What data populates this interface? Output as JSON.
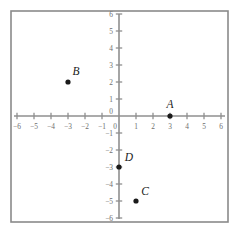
{
  "chart_data": {
    "type": "scatter",
    "title": "",
    "xlabel": "",
    "ylabel": "",
    "xlim": [
      -6.6,
      6.6
    ],
    "ylim": [
      -6.6,
      6.6
    ],
    "grid": false,
    "legend": null,
    "x_ticks": [
      -6,
      -5,
      -4,
      -3,
      -2,
      -1,
      0,
      1,
      2,
      3,
      4,
      5,
      6
    ],
    "y_ticks": [
      -6,
      -5,
      -4,
      -3,
      -2,
      -1,
      0,
      1,
      2,
      3,
      4,
      5,
      6
    ],
    "x_tick_labels": [
      "−6",
      "−5",
      "−4",
      "−3",
      "−2",
      "−1",
      "0",
      "1",
      "2",
      "3",
      "4",
      "5",
      "6"
    ],
    "y_tick_labels": [
      "−6",
      "−5",
      "−4",
      "−3",
      "−2",
      "−1",
      "0",
      "1",
      "2",
      "3",
      "4",
      "5",
      "6"
    ],
    "points": [
      {
        "label": "A",
        "x": 3,
        "y": 0,
        "label_dx": 0,
        "label_dy": -8
      },
      {
        "label": "B",
        "x": -3,
        "y": 2,
        "label_dx": 8,
        "label_dy": -7
      },
      {
        "label": "C",
        "x": 1,
        "y": -5,
        "label_dx": 9,
        "label_dy": -6
      },
      {
        "label": "D",
        "x": 0,
        "y": -3,
        "label_dx": 10,
        "label_dy": -6
      }
    ]
  },
  "style": {
    "axis_color": "#8f8f8f",
    "frame_color": "#8a8a8a",
    "point_color": "#1a1a1a",
    "tick_label_color": "#6e6e6e",
    "background": "#ffffff"
  },
  "geometry": {
    "origin_x": 119,
    "origin_y": 116,
    "unit": 17,
    "frame_left": 11,
    "frame_top": 11,
    "frame_right": 228,
    "frame_bottom": 222,
    "dot_radius": 2.6,
    "tick_half": 3.2
  }
}
